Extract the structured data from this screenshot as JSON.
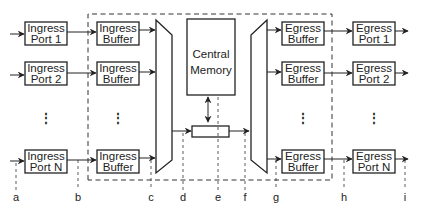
{
  "diagram": {
    "ingress_ports": [
      {
        "line1": "Ingress",
        "line2": "Port 1"
      },
      {
        "line1": "Ingress",
        "line2": "Port 2"
      },
      {
        "line1": "Ingress",
        "line2": "Port N"
      }
    ],
    "ingress_buffers": [
      {
        "line1": "Ingress",
        "line2": "Buffer"
      },
      {
        "line1": "Ingress",
        "line2": "Buffer"
      },
      {
        "line1": "Ingress",
        "line2": "Buffer"
      }
    ],
    "central_memory": {
      "line1": "Central",
      "line2": "Memory"
    },
    "egress_buffers": [
      {
        "line1": "Egress",
        "line2": "Buffer"
      },
      {
        "line1": "Egress",
        "line2": "Buffer"
      },
      {
        "line1": "Egress",
        "line2": "Buffer"
      }
    ],
    "egress_ports": [
      {
        "line1": "Egress",
        "line2": "Port 1"
      },
      {
        "line1": "Egress",
        "line2": "Port 2"
      },
      {
        "line1": "Egress",
        "line2": "Port N"
      }
    ],
    "ellipsis": "⋮",
    "tap_points": [
      "a",
      "b",
      "c",
      "d",
      "e",
      "f",
      "g",
      "h",
      "i"
    ]
  }
}
